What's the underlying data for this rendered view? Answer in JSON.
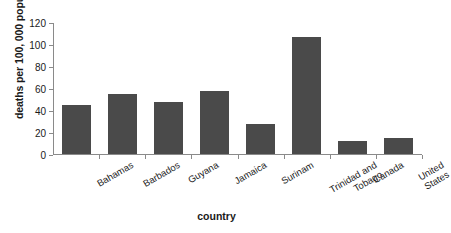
{
  "chart_data": {
    "type": "bar",
    "title": "",
    "xlabel": "country",
    "ylabel": "deaths per 100, 000 population",
    "categories": [
      "Bahamas",
      "Barbados",
      "Guyana",
      "Jamaica",
      "Surinam",
      "Trinidad and Tobago",
      "Canada",
      "United States"
    ],
    "category_lines": [
      [
        "Bahamas"
      ],
      [
        "Barbados"
      ],
      [
        "Guyana"
      ],
      [
        "Jamaica"
      ],
      [
        "Surinam"
      ],
      [
        "Trinidad and",
        "Tobago"
      ],
      [
        "Canada"
      ],
      [
        "United",
        "States"
      ]
    ],
    "values": [
      45,
      55,
      47,
      57,
      27,
      106,
      12,
      15
    ],
    "ylim": [
      0,
      120
    ],
    "yticks": [
      0,
      20,
      40,
      60,
      80,
      100,
      120
    ],
    "ytick_labels": [
      "0",
      "20",
      "40",
      "60",
      "80",
      "100",
      "120"
    ],
    "grid": false,
    "legend": "none",
    "bar_color": "#4a4a4a",
    "axis_color": "#8a8a8a",
    "background_color": "#ffffff"
  }
}
